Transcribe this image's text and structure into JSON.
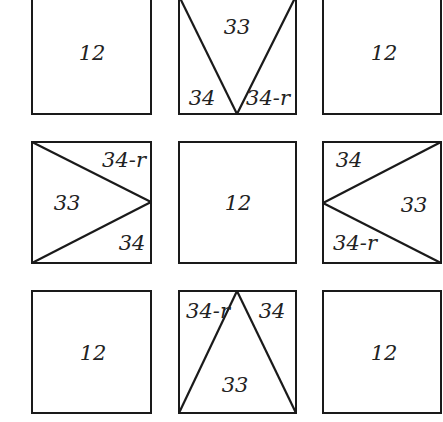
{
  "diagram": {
    "colors": {
      "stroke": "#1a1a1a",
      "text": "#222222",
      "background": "#ffffff"
    },
    "tiles": {
      "top_left": {
        "label": "12"
      },
      "top_center": {
        "center": "33",
        "left": "34",
        "right": "34-r"
      },
      "top_right": {
        "label": "12"
      },
      "middle_left": {
        "center": "33",
        "top": "34-r",
        "bottom": "34"
      },
      "middle_center": {
        "label": "12"
      },
      "middle_right": {
        "center": "33",
        "top": "34",
        "bottom": "34-r"
      },
      "bottom_left": {
        "label": "12"
      },
      "bottom_center": {
        "center": "33",
        "left": "34-r",
        "right": "34"
      },
      "bottom_right": {
        "label": "12"
      }
    }
  }
}
